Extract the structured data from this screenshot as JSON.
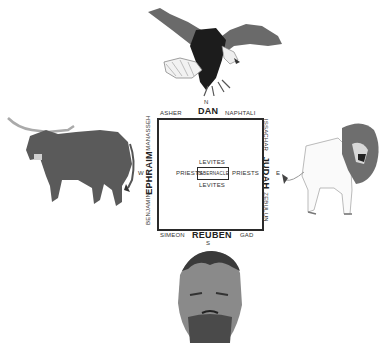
{
  "diagram": {
    "directions": {
      "north": "N",
      "south": "S",
      "east": "E",
      "west": "W"
    },
    "north": {
      "leader": "DAN",
      "left": "ASHER",
      "right": "NAPHTALI",
      "symbol": "eagle"
    },
    "south": {
      "leader": "REUBEN",
      "left": "SIMEON",
      "right": "GAD",
      "symbol": "man"
    },
    "west": {
      "leader": "EPHRAIM",
      "top": "MANASSEH",
      "bottom": "BENJAMIN",
      "symbol": "ox"
    },
    "east": {
      "leader": "JUDAH",
      "top": "ISSACHAR",
      "bottom": "ZEBULUN",
      "symbol": "lion"
    },
    "inner": {
      "center": "TABERNACLE",
      "north": "LEVITES",
      "south": "LEVITES",
      "west": "PRIESTS",
      "east": "PRIESTS"
    },
    "colors": {
      "ink": "#2a2a2a",
      "animal_dark": "#555555",
      "background": "#ffffff"
    }
  }
}
